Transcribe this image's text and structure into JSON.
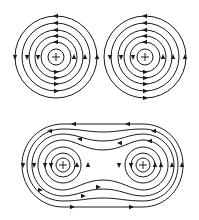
{
  "figure": {
    "line_color": "#1a1a1a",
    "background": "#ffffff"
  },
  "top_left": {
    "center": [
      56,
      57
    ],
    "radii": [
      8,
      15,
      21,
      27,
      34,
      41
    ],
    "marker": "+",
    "direction": "counterclockwise"
  },
  "top_right": {
    "center": [
      145,
      57
    ],
    "radii": [
      8,
      15,
      21,
      27,
      34,
      41
    ],
    "marker": "+",
    "direction": "counterclockwise"
  },
  "bottom": {
    "left_center": [
      63,
      165
    ],
    "right_center": [
      143,
      165
    ],
    "inner_radii": [
      8,
      13,
      18
    ],
    "marker": "+",
    "outer_loops": 3
  }
}
